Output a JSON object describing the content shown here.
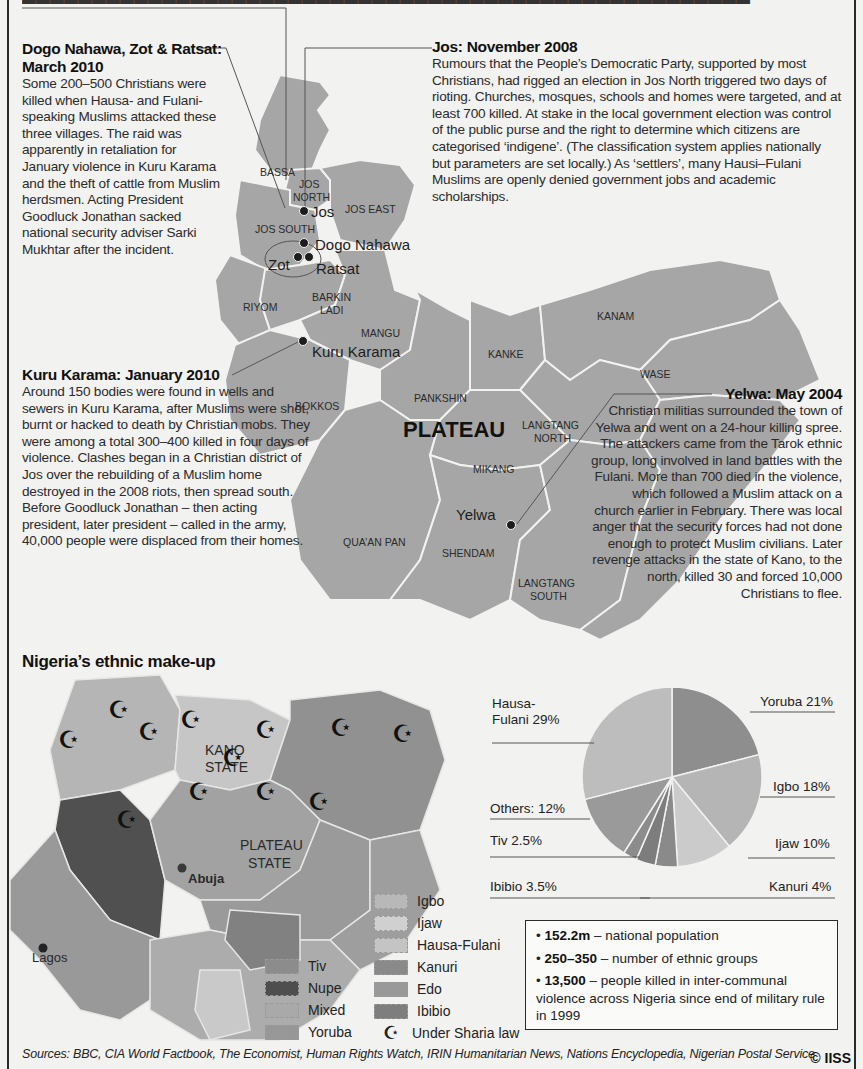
{
  "top_strip": "Partially cut-off caption line",
  "stories": {
    "dogo": {
      "title": "Dogo Nahawa, Zot & Ratsat: March 2010",
      "body": "Some 200–500 Christians were killed when Hausa- and Fulani-speaking Muslims attacked these three villages. The raid was apparently in retaliation for January violence in Kuru Karama and the theft of cattle from Muslim herdsmen. Acting President Goodluck Jonathan sacked national security adviser Sarki Mukhtar after the incident."
    },
    "jos": {
      "title": "Jos: November 2008",
      "body": "Rumours that the People’s Democratic Party, supported by most Christians, had rigged an election in Jos North triggered two days of rioting. Churches, mosques, schools and homes were targeted, and at least 700 killed. At stake in the local government election was control of the public purse and the right to determine which citizens are categorised ‘indigene’. (The classification system applies nationally but parameters are set locally.) As ‘settlers’, many Hausi–Fulani Muslims are openly denied government jobs and academic scholarships."
    },
    "kuru": {
      "title": "Kuru Karama: January 2010",
      "body": "Around 150 bodies were found in wells and sewers in Kuru Karama, after Muslims were shot, burnt or hacked to death by Christian mobs. They were among a total 300–400 killed in four days of violence. Clashes began in a Christian district of Jos over the rebuilding of a Muslim home destroyed in the 2008 riots, then spread south. Before Goodluck Jonathan – then acting president, later president – called in the army, 40,000 people were displaced from their homes."
    },
    "yelwa": {
      "title": "Yelwa: May 2004",
      "body": "Christian militias surrounded the town of Yelwa and went on a 24-hour killing spree. The attackers came from the Tarok ethnic group, long involved in land battles with the Fulani. More than 700 died in the violence, which followed a Muslim attack on a church earlier in February. There was local anger that the security forces had not done enough to protect Muslim civilians. Later revenge attacks in the state of Kano, to the north, killed 30 and forced 10,000 Christians to flee."
    }
  },
  "plateau_map": {
    "state_label": "PLATEAU",
    "lgas": [
      "BASSA",
      "JOS NORTH",
      "JOS EAST",
      "JOS SOUTH",
      "RIYOM",
      "BARKIN LADI",
      "MANGU",
      "BOKKOS",
      "PANKSHIN",
      "KANKE",
      "KANAM",
      "WASE",
      "LANGTANG NORTH",
      "MIKANG",
      "QUA’AN PAN",
      "SHENDAM",
      "LANGTANG SOUTH"
    ],
    "places": [
      "Jos",
      "Dogo Nahawa",
      "Zot",
      "Ratsat",
      "Kuru Karama",
      "Yelwa"
    ]
  },
  "ethnic_section": {
    "title": "Nigeria’s ethnic make-up",
    "map_labels": {
      "kano": "KANO STATE",
      "plateau": "PLATEAU STATE",
      "abuja": "Abuja",
      "lagos": "Lagos"
    },
    "legend": [
      {
        "label": "Tiv",
        "color": "#8c8c8c"
      },
      {
        "label": "Nupe",
        "color": "#4e4e4e"
      },
      {
        "label": "Mixed",
        "color": "#a9a9a9"
      },
      {
        "label": "Yoruba",
        "color": "#979797"
      },
      {
        "label": "Igbo",
        "color": "#b8b8b8"
      },
      {
        "label": "Ijaw",
        "color": "#d0d0d0"
      },
      {
        "label": "Hausa-Fulani",
        "color": "#c4c4c4"
      },
      {
        "label": "Kanuri",
        "color": "#8a8a8a"
      },
      {
        "label": "Edo",
        "color": "#999999"
      },
      {
        "label": "Ibibio",
        "color": "#7e7e7e"
      }
    ],
    "sharia_label": "Under Sharia law"
  },
  "chart_data": {
    "type": "pie",
    "title": "Nigeria’s ethnic make-up",
    "slices": [
      {
        "label": "Yoruba",
        "value": 21,
        "display": "Yoruba 21%",
        "color": "#8e8e8e"
      },
      {
        "label": "Igbo",
        "value": 18,
        "display": "Igbo 18%",
        "color": "#b5b5b5"
      },
      {
        "label": "Ijaw",
        "value": 10,
        "display": "Ijaw 10%",
        "color": "#cbcbcb"
      },
      {
        "label": "Kanuri",
        "value": 4,
        "display": "Kanuri 4%",
        "color": "#8a8a8a"
      },
      {
        "label": "Ibibio",
        "value": 3.5,
        "display": "Ibibio 3.5%",
        "color": "#7d7d7d"
      },
      {
        "label": "Tiv",
        "value": 2.5,
        "display": "Tiv 2.5%",
        "color": "#8c8c8c"
      },
      {
        "label": "Others",
        "value": 12,
        "display": "Others: 12%",
        "color": "#9a9a9a"
      },
      {
        "label": "Hausa-Fulani",
        "value": 29,
        "display": "Hausa-Fulani 29%",
        "color": "#bdbdbd"
      }
    ],
    "label_hausa_line1": "Hausa-",
    "label_hausa_line2": "Fulani 29%"
  },
  "facts": [
    {
      "bold": "152.2m",
      "text": " – national population"
    },
    {
      "bold": "250–350",
      "text": " – number of ethnic groups"
    },
    {
      "bold": "13,500",
      "text": " – people killed in inter-communal violence across Nigeria since end of military rule in 1999"
    }
  ],
  "sources": "Sources: BBC, CIA World Factbook, The Economist, Human Rights Watch, IRIN Humanitarian News, Nations Encyclopedia, Nigerian Postal Service",
  "copyright": "© IISS"
}
